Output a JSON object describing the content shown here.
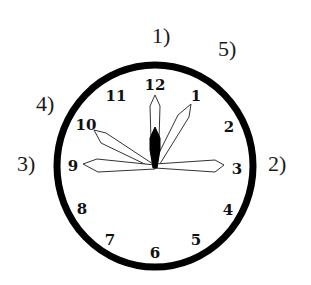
{
  "figure": {
    "colors": {
      "background": "#ffffff",
      "rim": "#000000",
      "hand_outline": "#333333",
      "hour_hand_fill": "#000000",
      "numeral": "#111111"
    },
    "clock": {
      "center": [
        155,
        167
      ],
      "rim_radius_x": 98,
      "rim_radius_y": 101,
      "rim_stroke_width": 7,
      "numerals": [
        {
          "text": "12",
          "x": 155,
          "y": 90
        },
        {
          "text": "1",
          "x": 196,
          "y": 101
        },
        {
          "text": "2",
          "x": 229,
          "y": 132
        },
        {
          "text": "3",
          "x": 237,
          "y": 174
        },
        {
          "text": "4",
          "x": 228,
          "y": 215
        },
        {
          "text": "5",
          "x": 196,
          "y": 245
        },
        {
          "text": "6",
          "x": 155,
          "y": 258
        },
        {
          "text": "7",
          "x": 110,
          "y": 245
        },
        {
          "text": "8",
          "x": 82,
          "y": 214
        },
        {
          "text": "9",
          "x": 73,
          "y": 171
        },
        {
          "text": "10",
          "x": 86,
          "y": 130
        },
        {
          "text": "11",
          "x": 116,
          "y": 101
        }
      ],
      "hands": [
        {
          "points_to": "12",
          "style": "outline"
        },
        {
          "points_to": "1",
          "style": "outline"
        },
        {
          "points_to": "10",
          "style": "outline"
        },
        {
          "points_to": "9",
          "style": "outline"
        },
        {
          "points_to": "3",
          "style": "outline"
        },
        {
          "points_to": "12",
          "style": "filled-short"
        }
      ]
    },
    "option_labels": [
      {
        "text": "1)",
        "x": 152,
        "y": 25
      },
      {
        "text": "2)",
        "x": 268,
        "y": 153
      },
      {
        "text": "3)",
        "x": 17,
        "y": 153
      },
      {
        "text": "4)",
        "x": 36,
        "y": 93
      },
      {
        "text": "5)",
        "x": 218,
        "y": 38
      }
    ]
  }
}
